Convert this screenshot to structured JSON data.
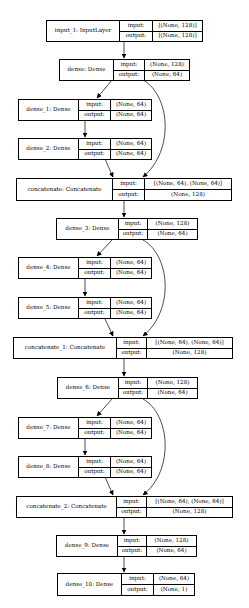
{
  "diagram": {
    "type": "keras-model-plot",
    "io_labels": {
      "input": "input:",
      "output": "output:"
    },
    "nodes": [
      {
        "id": "input_1",
        "label": "input_1: InputLayer",
        "input": "[(None, 128)]",
        "output": "[(None, 128)]"
      },
      {
        "id": "dense",
        "label": "dense: Dense",
        "input": "(None, 128)",
        "output": "(None, 64)"
      },
      {
        "id": "dense_1",
        "label": "dense_1: Dense",
        "input": "(None, 64)",
        "output": "(None, 64)"
      },
      {
        "id": "dense_2",
        "label": "dense_2: Dense",
        "input": "(None, 64)",
        "output": "(None, 64)"
      },
      {
        "id": "concatenate",
        "label": "concatenate: Concatenate",
        "input": "[(None, 64), (None, 64)]",
        "output": "(None, 128)"
      },
      {
        "id": "dense_3",
        "label": "dense_3: Dense",
        "input": "(None, 128)",
        "output": "(None, 64)"
      },
      {
        "id": "dense_4",
        "label": "dense_4: Dense",
        "input": "(None, 64)",
        "output": "(None, 64)"
      },
      {
        "id": "dense_5",
        "label": "dense_5: Dense",
        "input": "(None, 64)",
        "output": "(None, 64)"
      },
      {
        "id": "concatenate_1",
        "label": "concatenate_1: Concatenate",
        "input": "[(None, 64), (None, 64)]",
        "output": "(None, 128)"
      },
      {
        "id": "dense_6",
        "label": "dense_6: Dense",
        "input": "(None, 128)",
        "output": "(None, 64)"
      },
      {
        "id": "dense_7",
        "label": "dense_7: Dense",
        "input": "(None, 64)",
        "output": "(None, 64)"
      },
      {
        "id": "dense_8",
        "label": "dense_8: Dense",
        "input": "(None, 64)",
        "output": "(None, 64)"
      },
      {
        "id": "concatenate_2",
        "label": "concatenate_2: Concatenate",
        "input": "[(None, 64), (None, 64)]",
        "output": "(None, 128)"
      },
      {
        "id": "dense_9",
        "label": "dense_9: Dense",
        "input": "(None, 128)",
        "output": "(None, 64)"
      },
      {
        "id": "dense_10",
        "label": "dense_10: Dense",
        "input": "(None, 64)",
        "output": "(None, 1)"
      }
    ],
    "edges": [
      [
        "input_1",
        "dense"
      ],
      [
        "dense",
        "dense_1"
      ],
      [
        "dense_1",
        "dense_2"
      ],
      [
        "dense_2",
        "concatenate"
      ],
      [
        "dense",
        "concatenate"
      ],
      [
        "concatenate",
        "dense_3"
      ],
      [
        "dense_3",
        "dense_4"
      ],
      [
        "dense_4",
        "dense_5"
      ],
      [
        "dense_5",
        "concatenate_1"
      ],
      [
        "dense_3",
        "concatenate_1"
      ],
      [
        "concatenate_1",
        "dense_6"
      ],
      [
        "dense_6",
        "dense_7"
      ],
      [
        "dense_7",
        "dense_8"
      ],
      [
        "dense_8",
        "concatenate_2"
      ],
      [
        "dense_6",
        "concatenate_2"
      ],
      [
        "concatenate_2",
        "dense_9"
      ],
      [
        "dense_9",
        "dense_10"
      ]
    ]
  }
}
